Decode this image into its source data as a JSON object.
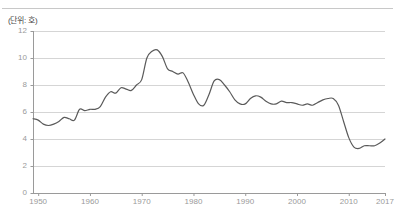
{
  "figure": {
    "unit_label": "(단위: 호)"
  },
  "chart_data": {
    "type": "line",
    "title": "",
    "subtitle": "",
    "xlabel": "",
    "ylabel": "",
    "unit_note": "(단위: 호)",
    "xlim": [
      1949,
      2017
    ],
    "ylim": [
      0,
      12
    ],
    "yticks": [
      0,
      2,
      4,
      6,
      8,
      10,
      12
    ],
    "ytick_labels": [
      "0",
      "2",
      "4",
      "6",
      "8",
      "10",
      "12"
    ],
    "xticks": [
      1950,
      1960,
      1970,
      1980,
      1990,
      2000,
      2010,
      2017
    ],
    "xtick_labels": [
      "1950",
      "1960",
      "1970",
      "1980",
      "1990",
      "2000",
      "2010",
      "2017"
    ],
    "grid": "horizontal",
    "legend": "none",
    "line_color": "#5a5a5a",
    "grid_color": "#d5d5d5",
    "axis_color": "#9a9a9a",
    "series": [
      {
        "name": "value",
        "x": [
          1949,
          1950,
          1951,
          1952,
          1953,
          1954,
          1955,
          1956,
          1957,
          1958,
          1959,
          1960,
          1961,
          1962,
          1963,
          1964,
          1965,
          1966,
          1967,
          1968,
          1969,
          1970,
          1971,
          1972,
          1973,
          1974,
          1975,
          1976,
          1977,
          1978,
          1979,
          1980,
          1981,
          1982,
          1983,
          1984,
          1985,
          1986,
          1987,
          1988,
          1989,
          1990,
          1991,
          1992,
          1993,
          1994,
          1995,
          1996,
          1997,
          1998,
          1999,
          2000,
          2001,
          2002,
          2003,
          2004,
          2005,
          2006,
          2007,
          2008,
          2009,
          2010,
          2011,
          2012,
          2013,
          2014,
          2015,
          2016,
          2017
        ],
        "y": [
          5.5,
          5.4,
          5.1,
          5.0,
          5.1,
          5.3,
          5.6,
          5.5,
          5.4,
          6.2,
          6.1,
          6.2,
          6.2,
          6.4,
          7.1,
          7.5,
          7.4,
          7.8,
          7.7,
          7.6,
          8.0,
          8.4,
          10.0,
          10.5,
          10.6,
          10.1,
          9.2,
          9.0,
          8.8,
          8.9,
          8.2,
          7.3,
          6.6,
          6.5,
          7.3,
          8.3,
          8.4,
          8.0,
          7.5,
          6.9,
          6.6,
          6.6,
          7.0,
          7.2,
          7.1,
          6.8,
          6.6,
          6.6,
          6.8,
          6.7,
          6.7,
          6.6,
          6.5,
          6.6,
          6.5,
          6.7,
          6.9,
          7.0,
          7.0,
          6.5,
          5.3,
          4.1,
          3.4,
          3.3,
          3.5,
          3.5,
          3.5,
          3.7,
          4.0
        ]
      }
    ]
  }
}
